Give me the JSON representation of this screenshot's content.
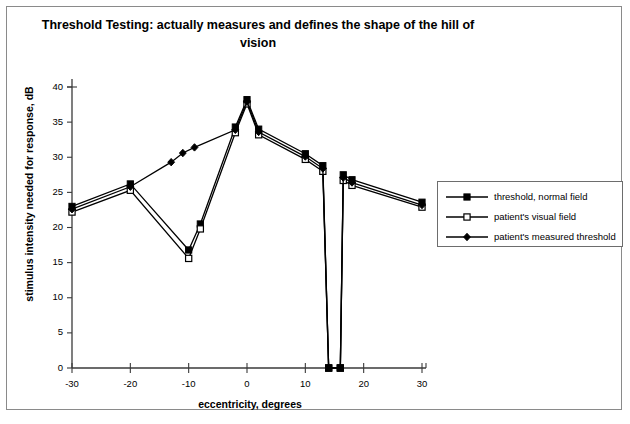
{
  "title": {
    "line1": "Threshold Testing:  actually measures and defines the shape of the hill of",
    "line2": "vision"
  },
  "axes": {
    "xlabel": "eccentricity, degrees",
    "ylabel": "stimulus intensity needed for response, dB",
    "xticks": [
      "-30",
      "-20",
      "-10",
      "0",
      "10",
      "20",
      "30"
    ],
    "yticks": [
      "0",
      "5",
      "10",
      "15",
      "20",
      "25",
      "30",
      "35",
      "40"
    ]
  },
  "legend": {
    "items": [
      {
        "label": "threshold, normal field",
        "marker": "filled-square",
        "color": "#000000"
      },
      {
        "label": "patient's visual field",
        "marker": "open-square",
        "color": "#000000"
      },
      {
        "label": "patient's measured threshold",
        "marker": "filled-diamond",
        "color": "#000000"
      }
    ]
  },
  "chart_data": {
    "type": "line",
    "title": "Threshold Testing:  actually measures and defines the shape of the hill of vision",
    "xlabel": "eccentricity, degrees",
    "ylabel": "stimulus intensity needed for response, dB",
    "xlim": [
      -30,
      30
    ],
    "ylim": [
      0,
      40
    ],
    "xticks": [
      -30,
      -20,
      -10,
      0,
      10,
      20,
      30
    ],
    "yticks": [
      0,
      5,
      10,
      15,
      20,
      25,
      30,
      35,
      40
    ],
    "grid": false,
    "legend_position": "right",
    "series": [
      {
        "name": "threshold, normal field",
        "marker": "filled-square",
        "color": "#000000",
        "points": [
          [
            -30,
            23.0
          ],
          [
            -20,
            26.2
          ],
          [
            -10,
            16.8
          ],
          [
            -8,
            20.5
          ],
          [
            -2,
            34.3
          ],
          [
            0,
            38.2
          ],
          [
            2,
            34.0
          ],
          [
            10,
            30.5
          ],
          [
            13,
            28.8
          ],
          [
            14,
            0.0
          ],
          [
            16,
            0.0
          ],
          [
            16.5,
            27.5
          ],
          [
            18,
            26.8
          ],
          [
            30,
            23.6
          ]
        ]
      },
      {
        "name": "patient's visual field",
        "marker": "open-square",
        "color": "#000000",
        "points": [
          [
            -30,
            22.2
          ],
          [
            -20,
            25.3
          ],
          [
            -10,
            15.6
          ],
          [
            -8,
            19.8
          ],
          [
            -2,
            33.5
          ],
          [
            0,
            37.6
          ],
          [
            2,
            33.2
          ],
          [
            10,
            29.7
          ],
          [
            13,
            28.0
          ],
          [
            14,
            0.0
          ],
          [
            16,
            0.0
          ],
          [
            16.5,
            26.7
          ],
          [
            18,
            26.0
          ],
          [
            30,
            22.9
          ]
        ]
      },
      {
        "name": "patient's measured threshold",
        "marker": "filled-diamond",
        "color": "#000000",
        "points": [
          [
            -30,
            22.6
          ],
          [
            -20,
            25.8
          ],
          [
            -13,
            29.3
          ],
          [
            -11,
            30.6
          ],
          [
            -9,
            31.4
          ],
          [
            -2,
            33.9
          ],
          [
            0,
            37.9
          ],
          [
            2,
            33.6
          ],
          [
            10,
            30.1
          ],
          [
            13,
            28.4
          ],
          [
            14,
            0.0
          ],
          [
            16,
            0.0
          ],
          [
            16.5,
            27.1
          ],
          [
            18,
            26.4
          ],
          [
            30,
            23.2
          ]
        ]
      }
    ],
    "annotations": [
      "blind spot: all series drop to 0 dB between 14 and 16 degrees"
    ]
  }
}
